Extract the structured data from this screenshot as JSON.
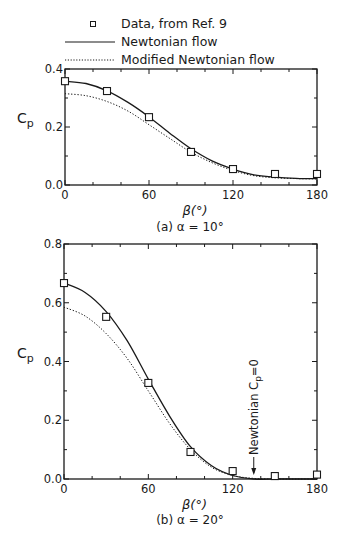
{
  "legend": {
    "items": [
      {
        "label": "Data, from Ref. 9",
        "symbol": "open-square"
      },
      {
        "label": "Newtonian flow",
        "symbol": "solid-line"
      },
      {
        "label": "Modified Newtonian flow",
        "symbol": "dotted-line"
      }
    ]
  },
  "colors": {
    "ink": "#1a1a1a",
    "background": "#ffffff"
  },
  "chart_data": [
    {
      "type": "line",
      "panel": "a",
      "caption": "(a) α = 10°",
      "xlabel": "β(°)",
      "ylabel": "Cp",
      "xlim": [
        0,
        180
      ],
      "ylim": [
        0,
        0.4
      ],
      "xticks": [
        0,
        60,
        120,
        180
      ],
      "xtick_labels": [
        "0",
        "60",
        "120",
        "180"
      ],
      "yticks": [
        0.0,
        0.2,
        0.4
      ],
      "ytick_labels": [
        "0.0",
        "0.2",
        "0.4"
      ],
      "grid": false,
      "legend_position": "top",
      "series": [
        {
          "name": "Newtonian flow",
          "style": "solid",
          "x": [
            0,
            15,
            30,
            45,
            60,
            75,
            90,
            105,
            120,
            135,
            150,
            165,
            180
          ],
          "y": [
            0.358,
            0.35,
            0.325,
            0.285,
            0.235,
            0.178,
            0.125,
            0.083,
            0.055,
            0.035,
            0.027,
            0.023,
            0.022
          ]
        },
        {
          "name": "Modified Newtonian flow",
          "style": "dotted",
          "x": [
            0,
            15,
            30,
            45,
            60,
            75,
            90,
            105,
            120,
            135,
            150,
            165,
            180
          ],
          "y": [
            0.315,
            0.308,
            0.288,
            0.255,
            0.208,
            0.16,
            0.113,
            0.077,
            0.05,
            0.032,
            0.025,
            0.022,
            0.021
          ]
        },
        {
          "name": "Data, from Ref. 9",
          "style": "markers",
          "x": [
            0,
            30,
            60,
            90,
            120,
            150,
            180
          ],
          "y": [
            0.358,
            0.324,
            0.234,
            0.114,
            0.055,
            0.038,
            0.038
          ]
        }
      ]
    },
    {
      "type": "line",
      "panel": "b",
      "caption": "(b) α = 20°",
      "xlabel": "β(°)",
      "ylabel": "Cp",
      "xlim": [
        0,
        180
      ],
      "ylim": [
        0,
        0.8
      ],
      "xticks": [
        0,
        60,
        120,
        180
      ],
      "xtick_labels": [
        "0",
        "60",
        "120",
        "180"
      ],
      "yticks": [
        0.0,
        0.2,
        0.4,
        0.6,
        0.8
      ],
      "ytick_labels": [
        "0.0",
        "0.2",
        "0.4",
        "0.6",
        "0.8"
      ],
      "grid": false,
      "annotations": [
        {
          "text": "Newtonian Cp=0",
          "x": 135,
          "y": 0.0,
          "arrow": true,
          "orientation": "vertical"
        }
      ],
      "series": [
        {
          "name": "Newtonian flow",
          "style": "solid",
          "x": [
            0,
            15,
            30,
            45,
            60,
            75,
            90,
            105,
            120,
            135,
            150,
            165,
            180
          ],
          "y": [
            0.667,
            0.635,
            0.57,
            0.47,
            0.34,
            0.215,
            0.11,
            0.045,
            0.012,
            0.0,
            0.0,
            0.0,
            0.0
          ]
        },
        {
          "name": "Modified Newtonian flow",
          "style": "dotted",
          "x": [
            0,
            15,
            30,
            45,
            60,
            75,
            90,
            105,
            120,
            135,
            150,
            165,
            180
          ],
          "y": [
            0.585,
            0.555,
            0.495,
            0.41,
            0.3,
            0.19,
            0.1,
            0.04,
            0.012,
            0.002,
            0.0,
            0.0,
            0.0
          ]
        },
        {
          "name": "Data, from Ref. 9",
          "style": "markers",
          "x": [
            0,
            30,
            60,
            90,
            120,
            150,
            180
          ],
          "y": [
            0.667,
            0.552,
            0.327,
            0.092,
            0.027,
            0.01,
            0.015
          ]
        }
      ]
    }
  ]
}
